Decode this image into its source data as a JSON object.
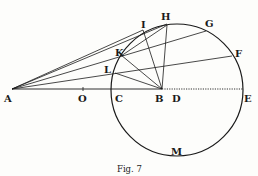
{
  "figure": {
    "caption": "Fig. 7",
    "ink_color": "#1a1a1a",
    "background": "#fdfdfb"
  },
  "points": {
    "A": {
      "label": "A"
    },
    "O": {
      "label": "O"
    },
    "C": {
      "label": "C"
    },
    "B": {
      "label": "B"
    },
    "D": {
      "label": "D"
    },
    "E": {
      "label": "E"
    },
    "F": {
      "label": "F"
    },
    "G": {
      "label": "G"
    },
    "H": {
      "label": "H"
    },
    "I": {
      "label": "I"
    },
    "K": {
      "label": "K"
    },
    "L": {
      "label": "L"
    },
    "M": {
      "label": "M"
    }
  }
}
